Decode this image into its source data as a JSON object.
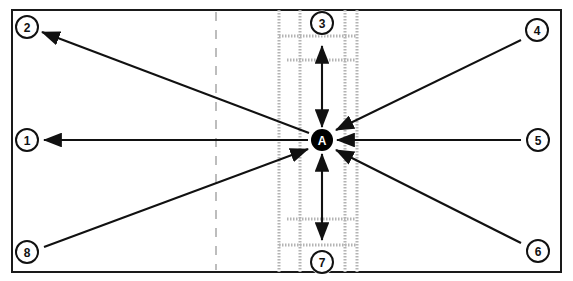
{
  "figure": {
    "name": "radial-flow-diagram",
    "background_color": "#ffffff",
    "frame_color": "#1a1a1a",
    "accent_color": "#000000",
    "corridor_color": "#b4b4b4",
    "dashed_guide_color": "#bdbdbd",
    "frame": {
      "x": 12,
      "y": 10,
      "width": 549,
      "height": 262
    }
  },
  "hub": {
    "label": "A",
    "name": "hub-node-a",
    "cx": 322,
    "cy": 140,
    "r": 11,
    "fill": "#000000",
    "text_color": "#ffffff"
  },
  "nodes": [
    {
      "id": "1",
      "label": "1",
      "name": "node-1",
      "cx": 27,
      "cy": 140,
      "r": 11,
      "position": "left-middle"
    },
    {
      "id": "2",
      "label": "2",
      "name": "node-2",
      "cx": 27,
      "cy": 27,
      "r": 11,
      "position": "top-left"
    },
    {
      "id": "3",
      "label": "3",
      "name": "node-3",
      "cx": 322,
      "cy": 23,
      "r": 11,
      "position": "top-center"
    },
    {
      "id": "4",
      "label": "4",
      "name": "node-4",
      "cx": 537,
      "cy": 30,
      "r": 11,
      "position": "top-right"
    },
    {
      "id": "5",
      "label": "5",
      "name": "node-5",
      "cx": 538,
      "cy": 140,
      "r": 11,
      "position": "right-middle"
    },
    {
      "id": "6",
      "label": "6",
      "name": "node-6",
      "cx": 538,
      "cy": 251,
      "r": 11,
      "position": "bottom-right"
    },
    {
      "id": "7",
      "label": "7",
      "name": "node-7",
      "cx": 322,
      "cy": 262,
      "r": 11,
      "position": "bottom-center"
    },
    {
      "id": "8",
      "label": "8",
      "name": "node-8",
      "cx": 27,
      "cy": 252,
      "r": 11,
      "position": "bottom-left"
    }
  ],
  "arrows": [
    {
      "name": "arrow-hub-to-node-1",
      "from": "A",
      "to": "1",
      "x1": 308,
      "y1": 140,
      "x2": 44,
      "y2": 140,
      "double": false
    },
    {
      "name": "arrow-hub-to-node-2",
      "from": "A",
      "to": "2",
      "x1": 309,
      "y1": 133,
      "x2": 42,
      "y2": 32,
      "double": false
    },
    {
      "name": "arrow-hub-to-node-3",
      "from": "A",
      "to": "3",
      "x1": 322,
      "y1": 127,
      "x2": 322,
      "y2": 46,
      "double": true
    },
    {
      "name": "arrow-node-4-to-hub",
      "from": "4",
      "to": "A",
      "x1": 521,
      "y1": 40,
      "x2": 336,
      "y2": 130,
      "double": false
    },
    {
      "name": "arrow-node-5-to-hub",
      "from": "5",
      "to": "A",
      "x1": 521,
      "y1": 140,
      "x2": 337,
      "y2": 140,
      "double": false
    },
    {
      "name": "arrow-node-6-to-hub",
      "from": "6",
      "to": "A",
      "x1": 521,
      "y1": 243,
      "x2": 336,
      "y2": 150,
      "double": false
    },
    {
      "name": "arrow-hub-to-node-7",
      "from": "A",
      "to": "7",
      "x1": 322,
      "y1": 154,
      "x2": 322,
      "y2": 240,
      "double": true
    },
    {
      "name": "arrow-node-8-to-hub",
      "from": "8",
      "to": "A",
      "x1": 44,
      "y1": 247,
      "x2": 308,
      "y2": 149,
      "double": false
    }
  ],
  "corridor": {
    "name": "vertical-corridor",
    "vertical_lines_x": [
      279,
      300,
      345,
      357
    ],
    "top": 10,
    "bottom": 272,
    "horizontal_bands": [
      {
        "name": "corridor-band-top-outer",
        "y": 36,
        "x1": 279,
        "x2": 357
      },
      {
        "name": "corridor-band-top-inner",
        "y": 60,
        "x1": 287,
        "x2": 356
      },
      {
        "name": "corridor-band-bottom-inner",
        "y": 219,
        "x1": 287,
        "x2": 356
      },
      {
        "name": "corridor-band-bottom-outer",
        "y": 245,
        "x1": 279,
        "x2": 357
      }
    ]
  },
  "guides": [
    {
      "name": "dashed-guide-left",
      "x": 216,
      "y1": 12,
      "y2": 270,
      "style": "dashed"
    }
  ]
}
